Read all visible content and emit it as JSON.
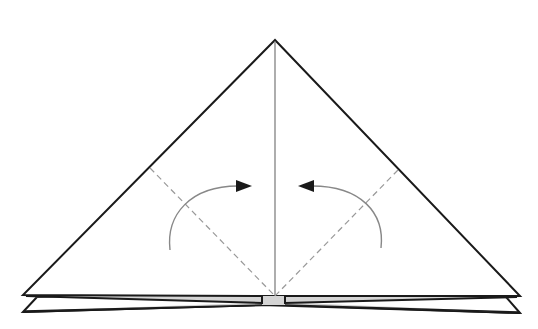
{
  "diagram": {
    "colors": {
      "outline": "#1a1a1a",
      "crease": "#777777",
      "dashed_fold": "#999999",
      "arrow": "#888888",
      "arrowhead": "#1a1a1a",
      "shaded_layers": "#d4d4d4",
      "paper": "#ffffff"
    },
    "elements": {
      "triangle": {
        "apex": [
          275,
          40
        ],
        "left": [
          23,
          295
        ],
        "right": [
          520,
          296
        ]
      },
      "center_crease": {
        "from": [
          275,
          40
        ],
        "to": [
          275,
          296
        ]
      },
      "dashed_fold_left": {
        "from": [
          150,
          168
        ],
        "to": [
          275,
          296
        ]
      },
      "dashed_fold_right": {
        "from": [
          398,
          170
        ],
        "to": [
          275,
          296
        ]
      },
      "arrow_left": {
        "direction": "right",
        "label": "fold-left-flap"
      },
      "arrow_right": {
        "direction": "left",
        "label": "fold-right-flap"
      },
      "lower_layers": {
        "count": 2
      }
    }
  }
}
